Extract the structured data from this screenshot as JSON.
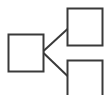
{
  "diagram": {
    "type": "tree-hierarchy-icon",
    "stroke_color": "#3a3a3a",
    "background": "#ffffff",
    "nodes": [
      {
        "id": "root",
        "label": ""
      },
      {
        "id": "child-top",
        "label": ""
      },
      {
        "id": "child-bottom",
        "label": ""
      }
    ],
    "edges": [
      {
        "from": "root",
        "to": "child-top"
      },
      {
        "from": "root",
        "to": "child-bottom"
      }
    ]
  }
}
